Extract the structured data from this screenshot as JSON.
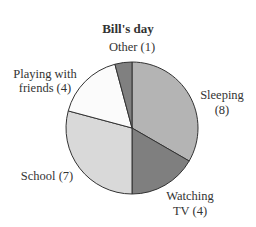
{
  "chart_data": {
    "type": "pie",
    "title": "Bill's day",
    "center": [
      132,
      128
    ],
    "radius": 66,
    "slices": [
      {
        "label": "Sleeping",
        "value": 8,
        "display": [
          "Sleeping",
          "(8)"
        ],
        "color": "#b4b4b4"
      },
      {
        "label": "Watching TV",
        "value": 4,
        "display": [
          "Watching",
          "TV (4)"
        ],
        "color": "#7f7f7f"
      },
      {
        "label": "School",
        "value": 7,
        "display": [
          "School (7)"
        ],
        "color": "#d9d9d9"
      },
      {
        "label": "Playing with friends",
        "value": 4,
        "display": [
          "Playing with",
          "friends (4)"
        ],
        "color": "#fbfbfb"
      },
      {
        "label": "Other",
        "value": 1,
        "display": [
          "Other (1)"
        ],
        "color": "#808080"
      }
    ]
  },
  "labels": {
    "title": "Bill's day",
    "other": "Other (1)",
    "playing_1": "Playing with",
    "playing_2": "friends (4)",
    "sleeping_1": "Sleeping",
    "sleeping_2": "(8)",
    "school": "School (7)",
    "watching_1": "Watching",
    "watching_2": "TV (4)"
  }
}
